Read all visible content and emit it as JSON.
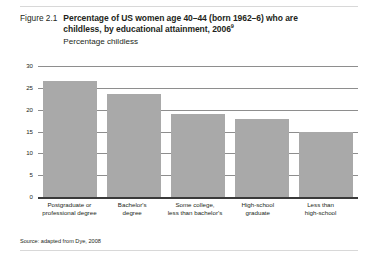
{
  "figure": {
    "number": "Figure 2.1",
    "title_line1": "Percentage of US women age 40–44 (born 1962–6) who are",
    "title_line2": "childless, by educational attainment, 2006",
    "title_footnote_marker": "9",
    "subtitle": "Percentage childless",
    "source": "Source: adapted from Dye, 2008"
  },
  "chart_data": {
    "type": "bar",
    "title": "Percentage of US women age 40–44 (born 1962–6) who are childless, by educational attainment, 2006",
    "subtitle": "Percentage childless",
    "xlabel": "",
    "ylabel": "Percentage childless",
    "ylim": [
      0,
      30
    ],
    "yticks": [
      0,
      5,
      10,
      15,
      20,
      25,
      30
    ],
    "ytick_labels": [
      "0",
      "5",
      "10",
      "15",
      "20",
      "25",
      "30"
    ],
    "grid": true,
    "legend": false,
    "bar_color": "#a9a9a9",
    "categories": [
      "Postgraduate or professional degree",
      "Bachelor's degree",
      "Some college, less than bachelor's",
      "High-school graduate",
      "Less than high-school"
    ],
    "category_lines": [
      [
        "Postgraduate or",
        "professional degree"
      ],
      [
        "Bachelor's",
        "degree"
      ],
      [
        "Some college,",
        "less than bachelor's"
      ],
      [
        "High-school",
        "graduate"
      ],
      [
        "Less than",
        "high-school"
      ]
    ],
    "values": [
      26.5,
      23.5,
      19.0,
      17.8,
      15.0
    ],
    "source": "adapted from Dye, 2008"
  }
}
